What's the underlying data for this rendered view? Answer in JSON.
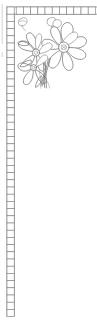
{
  "artwork": {
    "title": "Floral Corner Border",
    "subject": "cosmos-flower-corner-spray",
    "style": "line-art-outline",
    "width": 97,
    "height": 324,
    "background_color": "#ffffff",
    "line_color": "#6b6b6b",
    "accent_line_color": "#4a4a4a",
    "light_line_color": "#9a9a9a"
  },
  "border": {
    "name": "checkered-square-band",
    "shape": "L-shaped",
    "cell_size": 7.2,
    "band_thickness": 7.2,
    "top_band": {
      "x_start": 16.2,
      "y_start": 7.0,
      "cell_count": 11,
      "orientation": "horizontal"
    },
    "left_band": {
      "x_start": 7.0,
      "y_start": 7.0,
      "cell_count": 42,
      "orientation": "vertical"
    },
    "corner_cell": {
      "x": 7.0,
      "y": 7.0
    },
    "edge_marks": {
      "left_rule_x": 2.0,
      "left_rule_segments": [
        [
          2.0,
          4.0,
          2.0,
          44.0
        ],
        [
          2.0,
          52.0,
          2.0,
          56.0
        ]
      ]
    }
  },
  "flowers": [
    {
      "name": "main-flower-large",
      "type": "cosmos-bloom",
      "center_x": 63.5,
      "center_y": 47.0,
      "petal_count": 8,
      "radius": 21.0,
      "center_radius": 5.0
    },
    {
      "name": "secondary-flower",
      "type": "cosmos-bloom",
      "center_x": 36.0,
      "center_y": 53.0,
      "petal_count": 6,
      "radius": 16.0,
      "center_radius": 3.6
    },
    {
      "name": "lower-flower",
      "type": "cosmos-bloom-partial",
      "center_x": 34.0,
      "center_y": 66.0,
      "petal_count": 4,
      "radius": 14.0,
      "center_radius": 3.0
    }
  ],
  "buds": [
    {
      "name": "corner-bud",
      "x": 23.0,
      "y": 23.0,
      "length": 10.0
    },
    {
      "name": "upper-right-bud",
      "x": 52.0,
      "y": 21.0,
      "length": 9.0
    }
  ],
  "stems": [
    {
      "name": "stem-main",
      "from_x": 50.0,
      "from_y": 60.0,
      "to_x": 42.0,
      "to_y": 86.0
    },
    {
      "name": "stem-secondary",
      "from_x": 46.0,
      "from_y": 62.0,
      "to_x": 40.0,
      "to_y": 84.0
    },
    {
      "name": "stem-lower",
      "from_x": 44.0,
      "from_y": 64.0,
      "to_x": 46.0,
      "to_y": 88.0
    }
  ],
  "leaves": [
    {
      "name": "leaf-left",
      "x": 25.0,
      "y": 44.0
    },
    {
      "name": "leaf-lower-left",
      "x": 26.0,
      "y": 62.0
    },
    {
      "name": "leaf-bottom",
      "x": 40.0,
      "y": 80.0
    }
  ],
  "labels": {
    "artboard": "Floral corner border line art",
    "border_region": "Checkered square border band",
    "floral_region": "Corner floral spray"
  }
}
